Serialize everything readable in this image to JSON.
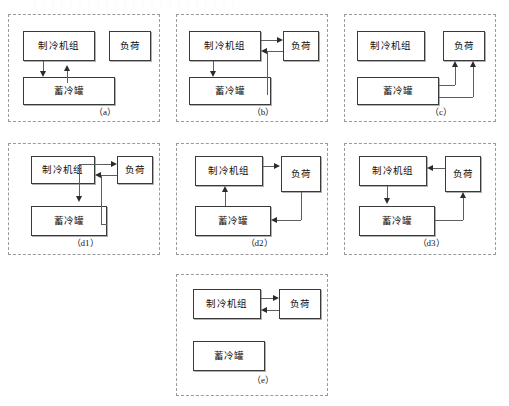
{
  "figure": {
    "width": 509,
    "height": 406,
    "line_color": "#5e5e5e",
    "box_border_color": "#3a3a3a",
    "panel_border_color": "#9a9a9a"
  },
  "labels": {
    "chiller": "制冷机组",
    "load": "负荷",
    "tank": "蓄冷罐"
  },
  "panels": [
    {
      "id": "a",
      "caption": "（a）",
      "description": "Chiller charges tank and tank returns to chiller; load isolated",
      "boxes": {
        "chiller": "制冷机组",
        "load": "负荷",
        "tank": "蓄冷罐"
      }
    },
    {
      "id": "b",
      "caption": "（b）",
      "description": "Chiller supplies load, load returns to chiller, chiller charges tank",
      "boxes": {
        "chiller": "制冷机组",
        "load": "负荷",
        "tank": "蓄冷罐"
      }
    },
    {
      "id": "c",
      "caption": "（c）",
      "description": "Tank supplies load with two return paths; chiller idle",
      "boxes": {
        "chiller": "制冷机组",
        "load": "负荷",
        "tank": "蓄冷罐"
      }
    },
    {
      "id": "d1",
      "caption": "（d1）",
      "description": "Chiller supplies load and charges tank; load and tank return to chiller",
      "boxes": {
        "chiller": "制冷机组",
        "load": "负荷",
        "tank": "蓄冷罐"
      }
    },
    {
      "id": "d2",
      "caption": "（d2）",
      "description": "Chiller supplies load, load returns to tank, tank returns to chiller",
      "boxes": {
        "chiller": "制冷机组",
        "load": "负荷",
        "tank": "蓄冷罐"
      }
    },
    {
      "id": "d3",
      "caption": "（d3）",
      "description": "Load returns to chiller, chiller charges tank, tank supplies load",
      "boxes": {
        "chiller": "制冷机组",
        "load": "负荷",
        "tank": "蓄冷罐"
      }
    },
    {
      "id": "e",
      "caption": "（e）",
      "description": "Chiller supplies load and load returns to chiller; tank idle",
      "boxes": {
        "chiller": "制冷机组",
        "load": "负荷",
        "tank": "蓄冷罐"
      }
    }
  ]
}
